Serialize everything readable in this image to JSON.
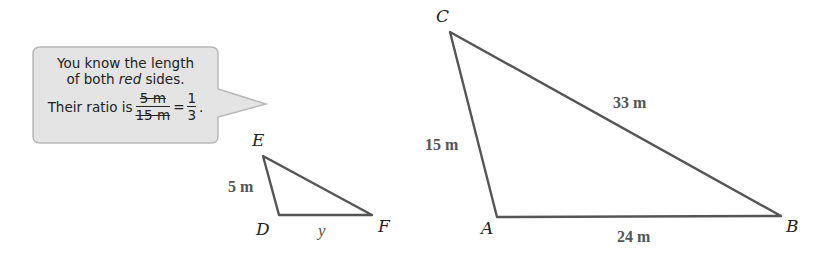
{
  "callout": {
    "line1": "You know the length",
    "line2_pre": "of both ",
    "line2_em": "red",
    "line2_post": " sides.",
    "line3_pre": "Their ratio is",
    "frac1_num": "5 m",
    "frac1_den": "15 m",
    "equals": "=",
    "frac2_num": "1",
    "frac2_den": "3",
    "period": "."
  },
  "small_triangle": {
    "vertices": {
      "E": "E",
      "D": "D",
      "F": "F"
    },
    "sides": {
      "DE": "5 m",
      "DF": "y"
    }
  },
  "large_triangle": {
    "vertices": {
      "C": "C",
      "A": "A",
      "B": "B"
    },
    "sides": {
      "AC": "15 m",
      "BC": "33 m",
      "AB": "24 m"
    }
  },
  "colors": {
    "callout_fill": "#e4e4e4",
    "callout_border": "#b8b8b8",
    "stroke": "#555555"
  }
}
